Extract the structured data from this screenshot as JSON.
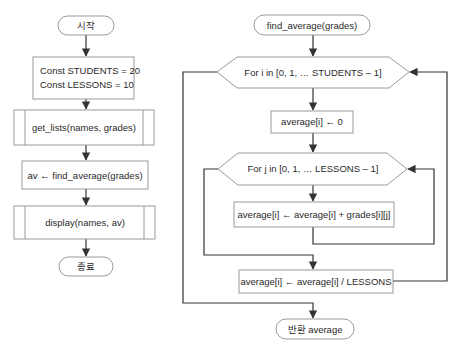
{
  "main_flowchart": {
    "start": "시작",
    "constants": [
      "Const STUDENTS = 20",
      "Const LESSONS = 10"
    ],
    "get_lists": "get_lists(names, grades)",
    "assign_av": "av ← find_average(grades)",
    "display": "display(names, av)",
    "end": "종료"
  },
  "function_flowchart": {
    "header": "find_average(grades)",
    "outer_loop": "For i in [0, 1, … STUDENTS – 1]",
    "init": "average[i] ← 0",
    "inner_loop": "For j in [0, 1, … LESSONS – 1]",
    "accumulate": "average[i] ← average[i] + grades[i][j]",
    "divide": "average[i] ← average[i] / LESSONS",
    "return": "반환 average"
  },
  "colors": {
    "shape_border": "#9a9a9a",
    "connector": "#333333",
    "text": "#2a2a2a",
    "background": "#ffffff"
  }
}
